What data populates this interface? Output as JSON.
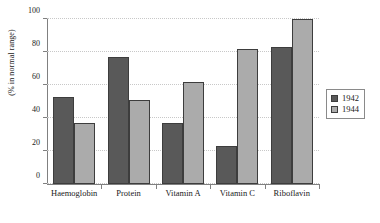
{
  "chart_data": {
    "type": "bar",
    "title": "",
    "xlabel": "",
    "ylabel": "(% in normal range)",
    "ylim": [
      0,
      100
    ],
    "yticks": [
      0,
      20,
      40,
      60,
      80,
      100
    ],
    "grid": true,
    "legend_position": "right",
    "categories": [
      "Haemoglobin",
      "Protein",
      "Vitamin A",
      "Vitamin C",
      "Riboflavin"
    ],
    "series": [
      {
        "name": "1942",
        "color": "#595959",
        "values": [
          53,
          77,
          37,
          23,
          83
        ]
      },
      {
        "name": "1944",
        "color": "#ababab",
        "values": [
          37,
          51,
          62,
          82,
          100
        ]
      }
    ]
  },
  "legend": {
    "entries": [
      {
        "label": "1942"
      },
      {
        "label": "1944"
      }
    ]
  },
  "colors": {
    "series_1942": "#595959",
    "series_1944": "#ababab",
    "axis": "#808080",
    "gridline": "#c8c8c8",
    "bar_outline": "#3d3d3d",
    "text": "#1a1a1a",
    "background": "#ffffff"
  }
}
